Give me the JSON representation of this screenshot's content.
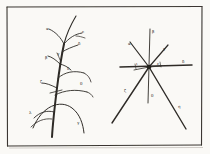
{
  "plate": {
    "background_color": "#fdfdfc",
    "ink_color": "#2a2724",
    "frame_color": "#3a3631",
    "paper_tone": "#f2f0ec",
    "frame": {
      "x": 6,
      "y": 6,
      "width": 196,
      "height": 140
    }
  },
  "figures": [
    {
      "id": "left-figure",
      "name": "branching-plant-diagram",
      "description": "Upright plant axis with curved lateral branches rising and arching, each branch tipped with a Greek letter label",
      "labels": [
        {
          "key": "alpha",
          "glyph": "α",
          "x": 46,
          "y": 28
        },
        {
          "key": "epsilon",
          "glyph": "ε",
          "x": 80,
          "y": 33
        },
        {
          "key": "delta1",
          "glyph": "δ",
          "x": 76,
          "y": 44
        },
        {
          "key": "beta",
          "glyph": "β",
          "x": 46,
          "y": 57
        },
        {
          "key": "gamma1",
          "glyph": "γ",
          "x": 57,
          "y": 54
        },
        {
          "key": "delta2",
          "glyph": "δ",
          "x": 66,
          "y": 68
        },
        {
          "key": "zeta",
          "glyph": "ζ",
          "x": 41,
          "y": 82
        },
        {
          "key": "theta",
          "glyph": "θ",
          "x": 79,
          "y": 83
        },
        {
          "key": "lambda",
          "glyph": "λ",
          "x": 30,
          "y": 112
        },
        {
          "key": "gamma2",
          "glyph": "γ",
          "x": 76,
          "y": 122
        }
      ]
    },
    {
      "id": "right-figure",
      "name": "radial-ray-angle-diagram",
      "description": "Eight rays radiating from a common dark centre point; a long horizontal axis and a vertical axis cross at the node, with Greek letters marking each ray",
      "center": {
        "x": 149,
        "y": 67
      },
      "labels": [
        {
          "key": "beta",
          "glyph": "β",
          "x": 151,
          "y": 31
        },
        {
          "key": "alpha",
          "glyph": "α",
          "x": 130,
          "y": 44
        },
        {
          "key": "gamma",
          "glyph": "γ",
          "x": 162,
          "y": 48
        },
        {
          "key": "iota",
          "glyph": "ι",
          "x": 137,
          "y": 64
        },
        {
          "key": "epsilon",
          "glyph": "ε",
          "x": 158,
          "y": 64
        },
        {
          "key": "delta",
          "glyph": "δ",
          "x": 183,
          "y": 63
        },
        {
          "key": "zeta",
          "glyph": "ζ",
          "x": 125,
          "y": 91
        },
        {
          "key": "theta",
          "glyph": "θ",
          "x": 150,
          "y": 96
        },
        {
          "key": "eta",
          "glyph": "η",
          "x": 177,
          "y": 106
        }
      ]
    }
  ]
}
